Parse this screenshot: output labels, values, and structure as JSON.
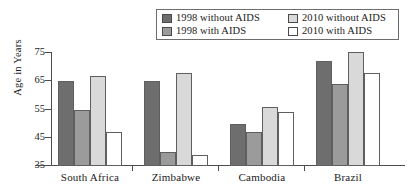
{
  "chart_data": {
    "type": "bar",
    "title": "",
    "xlabel": "",
    "ylabel": "Age in Years",
    "ylim": [
      35,
      75
    ],
    "yticks": [
      35,
      45,
      55,
      65,
      75
    ],
    "grid": false,
    "legend_position": "top-right",
    "categories": [
      "South Africa",
      "Zimbabwe",
      "Cambodia",
      "Brazil"
    ],
    "series": [
      {
        "name": "1998 without AIDS",
        "color": "#6e6e6e",
        "values": [
          65,
          65,
          50,
          72
        ]
      },
      {
        "name": "1998 with AIDS",
        "color": "#9b9b9b",
        "values": [
          55,
          40,
          47,
          64
        ]
      },
      {
        "name": "2010 without AIDS",
        "color": "#d9d9d9",
        "values": [
          67,
          68,
          56,
          75.5
        ]
      },
      {
        "name": "2010 with AIDS",
        "color": "#ffffff",
        "values": [
          47,
          39,
          54,
          68
        ]
      }
    ]
  }
}
